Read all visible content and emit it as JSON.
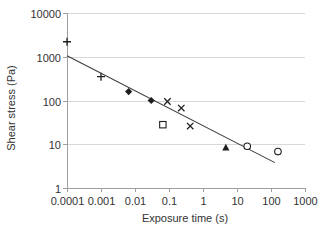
{
  "figure": {
    "background": "#ffffff"
  },
  "chart_data": {
    "type": "scatter",
    "title": "",
    "xlabel": "Exposure time (s)",
    "ylabel": "Shear stress (Pa)",
    "x_scale": "log",
    "y_scale": "log",
    "xlim": [
      0.0001,
      1000
    ],
    "ylim": [
      1,
      10000
    ],
    "x_ticks": [
      0.0001,
      0.001,
      0.01,
      0.1,
      1,
      10,
      100,
      1000
    ],
    "x_tick_labels": [
      "0.0001",
      "0.001",
      "0.01",
      "0.1",
      "1",
      "10",
      "100",
      "1000"
    ],
    "y_ticks": [
      1,
      10,
      100,
      1000,
      10000
    ],
    "y_tick_labels": [
      "1",
      "10",
      "100",
      "1000",
      "10000"
    ],
    "grid": "horizontal",
    "legend": "none",
    "series": [
      {
        "name": "plus-markers",
        "marker": "plus",
        "points": [
          {
            "x": 0.0001,
            "y": 2200
          },
          {
            "x": 0.001,
            "y": 350
          }
        ]
      },
      {
        "name": "filled-diamond-markers",
        "marker": "diamond-filled",
        "points": [
          {
            "x": 0.0065,
            "y": 160
          },
          {
            "x": 0.03,
            "y": 100
          }
        ]
      },
      {
        "name": "cross-markers",
        "marker": "cross",
        "points": [
          {
            "x": 0.09,
            "y": 95
          },
          {
            "x": 0.23,
            "y": 67
          },
          {
            "x": 0.42,
            "y": 26
          }
        ]
      },
      {
        "name": "open-square-markers",
        "marker": "square-open",
        "points": [
          {
            "x": 0.066,
            "y": 28
          }
        ]
      },
      {
        "name": "filled-triangle-markers",
        "marker": "triangle-filled",
        "points": [
          {
            "x": 4.7,
            "y": 8.5
          }
        ]
      },
      {
        "name": "open-circle-markers",
        "marker": "circle-open",
        "points": [
          {
            "x": 20,
            "y": 9
          },
          {
            "x": 160,
            "y": 6.8
          }
        ]
      }
    ],
    "trendline": {
      "x1": 0.0001,
      "y1": 1050,
      "x2": 130,
      "y2": 3.8
    },
    "colors": {
      "marker": "#1f1f1f",
      "trendline": "#3c3c3c",
      "grid": "#d8d8d8",
      "axis": "#a0a0a0",
      "text": "#333333",
      "open_marker_fill": "#ffffff"
    }
  }
}
